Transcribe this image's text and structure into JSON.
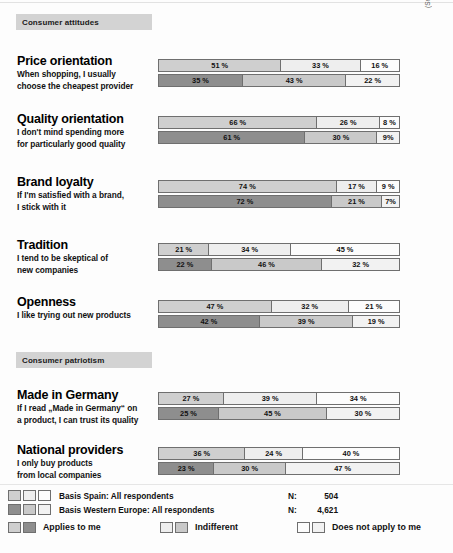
{
  "source_credit": "(Source: TNS Infratest/MRSC, 2005)",
  "sections": [
    {
      "band_label": "Consumer attitudes",
      "items": [
        {
          "title": "Price orientation",
          "subtitle_lines": [
            "When shopping, I usually",
            "choose the cheapest provider"
          ],
          "spain": [
            51,
            33,
            16
          ],
          "western_europe": [
            35,
            43,
            22
          ],
          "spain_labels": [
            "51 %",
            "33 %",
            "16 %"
          ],
          "western_europe_labels": [
            "35 %",
            "43 %",
            "22 %"
          ]
        },
        {
          "title": "Quality orientation",
          "subtitle_lines": [
            "I don't mind spending more",
            "for particularly good quality"
          ],
          "spain": [
            66,
            26,
            8
          ],
          "western_europe": [
            61,
            30,
            9
          ],
          "spain_labels": [
            "66 %",
            "26 %",
            "8 %"
          ],
          "western_europe_labels": [
            "61 %",
            "30 %",
            "9%"
          ]
        },
        {
          "title": "Brand loyalty",
          "subtitle_lines": [
            "If I'm satisfied with a brand,",
            "I stick with it"
          ],
          "spain": [
            74,
            17,
            9
          ],
          "western_europe": [
            72,
            21,
            7
          ],
          "spain_labels": [
            "74 %",
            "17 %",
            "9 %"
          ],
          "western_europe_labels": [
            "72 %",
            "21 %",
            "7%"
          ]
        },
        {
          "title": "Tradition",
          "subtitle_lines": [
            "I tend to be skeptical of",
            "new companies"
          ],
          "spain": [
            21,
            34,
            45
          ],
          "western_europe": [
            22,
            46,
            32
          ],
          "spain_labels": [
            "21 %",
            "34 %",
            "45 %"
          ],
          "western_europe_labels": [
            "22 %",
            "46 %",
            "32 %"
          ]
        },
        {
          "title": "Openness",
          "subtitle_lines": [
            "I like trying out new products"
          ],
          "spain": [
            47,
            32,
            21
          ],
          "western_europe": [
            42,
            39,
            19
          ],
          "spain_labels": [
            "47 %",
            "32 %",
            "21 %"
          ],
          "western_europe_labels": [
            "42 %",
            "39 %",
            "19 %"
          ]
        }
      ]
    },
    {
      "band_label": "Consumer patriotism",
      "items": [
        {
          "title": "Made in Germany",
          "subtitle_lines": [
            "If I read „Made in Germany“ on",
            "a product, I can trust its quality"
          ],
          "spain": [
            27,
            39,
            34
          ],
          "western_europe": [
            25,
            45,
            30
          ],
          "spain_labels": [
            "27 %",
            "39 %",
            "34 %"
          ],
          "western_europe_labels": [
            "25 %",
            "45 %",
            "30 %"
          ]
        },
        {
          "title": "National providers",
          "subtitle_lines": [
            "I only buy products",
            "from local companies"
          ],
          "spain": [
            36,
            24,
            40
          ],
          "western_europe": [
            23,
            30,
            47
          ],
          "spain_labels": [
            "36 %",
            "24 %",
            "40 %"
          ],
          "western_europe_labels": [
            "23 %",
            "30 %",
            "47 %"
          ]
        }
      ]
    }
  ],
  "legend": {
    "basis": [
      {
        "text": "Basis Spain: All respondents",
        "n_label": "N:",
        "n_value": "504"
      },
      {
        "text": "Basis Western Europe: All respondents",
        "n_label": "N:",
        "n_value": "4,621"
      }
    ],
    "keys": [
      {
        "text": "Applies to me"
      },
      {
        "text": "Indifferent"
      },
      {
        "text": "Does not apply to me"
      }
    ]
  },
  "chart_data": {
    "type": "bar",
    "orientation": "horizontal-stacked",
    "stacked": true,
    "unit": "%",
    "xlabel": "",
    "ylabel": "",
    "xlim": [
      0,
      100
    ],
    "grid": false,
    "legend_position": "bottom",
    "legend_entries": [
      "Applies to me",
      "Indifferent",
      "Does not apply to me"
    ],
    "series": [
      {
        "name": "Basis Spain: All respondents",
        "n": 504,
        "color": "#cfcfcf"
      },
      {
        "name": "Basis Western Europe: All respondents",
        "n": 4621,
        "color": "#8e8e8e"
      }
    ],
    "groups": [
      {
        "section": "Consumer attitudes",
        "categories": [
          "Price orientation",
          "Quality orientation",
          "Brand loyalty",
          "Tradition",
          "Openness"
        ],
        "spain": [
          [
            51,
            33,
            16
          ],
          [
            66,
            26,
            8
          ],
          [
            74,
            17,
            9
          ],
          [
            21,
            34,
            45
          ],
          [
            47,
            32,
            21
          ]
        ],
        "western_europe": [
          [
            35,
            43,
            22
          ],
          [
            61,
            30,
            9
          ],
          [
            72,
            21,
            7
          ],
          [
            22,
            46,
            32
          ],
          [
            42,
            39,
            19
          ]
        ]
      },
      {
        "section": "Consumer patriotism",
        "categories": [
          "Made in Germany",
          "National providers"
        ],
        "spain": [
          [
            27,
            39,
            34
          ],
          [
            36,
            24,
            40
          ]
        ],
        "western_europe": [
          [
            25,
            45,
            30
          ],
          [
            23,
            30,
            47
          ]
        ]
      }
    ],
    "annotations": [
      "(Source: TNS Infratest/MRSC, 2005)"
    ]
  }
}
